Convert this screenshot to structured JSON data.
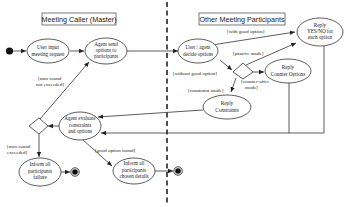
{
  "diagram": {
    "type": "activity-diagram",
    "lanes": [
      {
        "id": "master",
        "title": "Meeting Caller (Master)"
      },
      {
        "id": "participants",
        "title": "Other Meeting Participants"
      }
    ],
    "nodes": {
      "user_input": [
        "User input",
        "meeting request"
      ],
      "agent_send": [
        "Agent send",
        "options to",
        "participants"
      ],
      "decide": [
        "User / agent",
        "decide options"
      ],
      "reply_yesno": [
        "Reply",
        "YES/NO for",
        "each option"
      ],
      "reply_counter": [
        "Reply",
        "Counter Options"
      ],
      "reply_constraints": [
        "Reply",
        "Constraints"
      ],
      "evaluate": [
        "Agent evaluate",
        "constraints",
        "and options"
      ],
      "inform_failure": [
        "Inform all",
        "participants",
        "failure"
      ],
      "inform_chosen": [
        "Inform all",
        "participants",
        "chosen details"
      ]
    },
    "guards": {
      "with_good": "[with good option]",
      "without_good": "[without good option]",
      "passive": "[passive mode]",
      "counter_offer": [
        "[counter-offer",
        "mode]"
      ],
      "constraint": "[constraint mode]",
      "max_not_exceeded": [
        "[max round",
        "not exceeded]"
      ],
      "max_exceeded": [
        "[max round",
        "exceeded]"
      ],
      "good_found": "[good option found]"
    }
  }
}
